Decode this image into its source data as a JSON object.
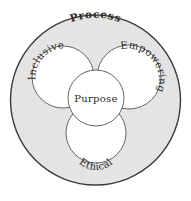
{
  "diagram": {
    "outer": {
      "label": "Process",
      "fill": "#e4e4e4",
      "stroke": "#3a3a3a"
    },
    "circles": [
      {
        "id": "inclusive",
        "label": "Inclusive"
      },
      {
        "id": "empowering",
        "label": "Empowering"
      },
      {
        "id": "ethical",
        "label": "Ethical"
      },
      {
        "id": "purpose",
        "label": "Purpose"
      }
    ],
    "inner_fill": "#ffffff",
    "inner_stroke": "#555555"
  }
}
